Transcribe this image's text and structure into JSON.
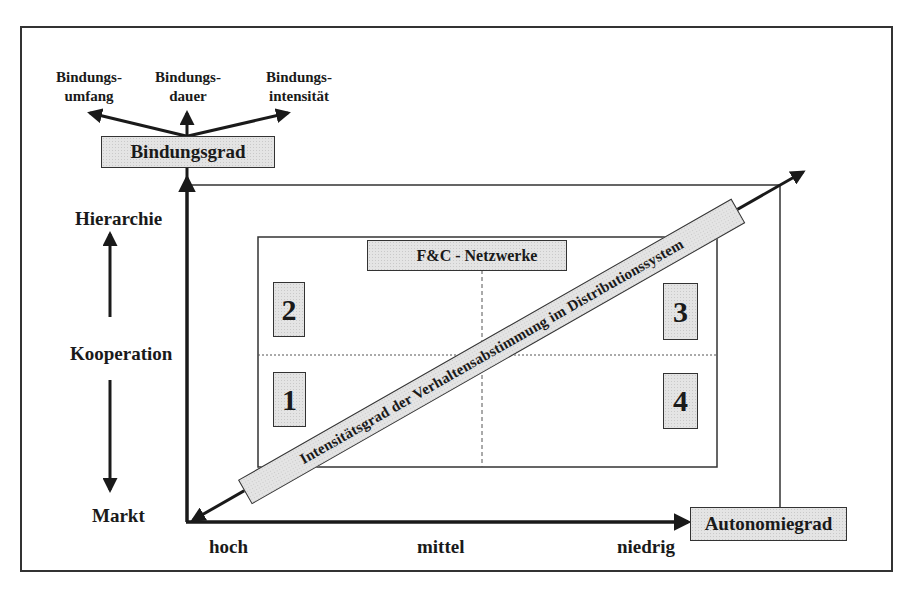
{
  "diagram": {
    "top_labels": [
      {
        "line1": "Bindungs-",
        "line2": "umfang"
      },
      {
        "line1": "Bindungs-",
        "line2": "dauer"
      },
      {
        "line1": "Bindungs-",
        "line2": "intensität"
      }
    ],
    "y_axis_box": "Bindungsgrad",
    "x_axis_box": "Autonomiegrad",
    "y_scale": {
      "top": "Hierarchie",
      "middle": "Kooperation",
      "bottom": "Markt"
    },
    "x_scale": {
      "left": "hoch",
      "middle": "mittel",
      "right": "niedrig"
    },
    "network_label": "F&C - Netzwerke",
    "quadrants": [
      {
        "id": "2",
        "label": "2"
      },
      {
        "id": "1",
        "label": "1"
      },
      {
        "id": "3",
        "label": "3"
      },
      {
        "id": "4",
        "label": "4"
      }
    ],
    "diagonal_label": "Intensitätsgrad der Verhaltensabstimmung im Distributionssystem",
    "colors": {
      "line": "#1a1a1a",
      "box_fill": "#e4e4e4",
      "background": "#ffffff"
    }
  }
}
